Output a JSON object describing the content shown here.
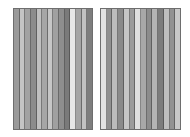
{
  "figure": {
    "panels": [
      {
        "id": "left",
        "stripes": [
          "#9a9a9a",
          "#c4c4c4",
          "#a2a2a2",
          "#8c8c8c",
          "#c0c0c0",
          "#a6a6a6",
          "#c6c6c6",
          "#a0a0a0",
          "#8e8e8e",
          "#7a7a7a",
          "#e6e6e6",
          "#a4a4a4",
          "#c2c2c2",
          "#7e7e7e"
        ]
      },
      {
        "id": "right",
        "stripes": [
          "#e2e2e2",
          "#909090",
          "#bcbcbc",
          "#8a8a8a",
          "#c6c6c6",
          "#9c9c9c",
          "#e0e0e0",
          "#a8a8a8",
          "#8c8c8c",
          "#b4b4b4",
          "#7c7c7c",
          "#bebebe",
          "#929292",
          "#c8c8c8"
        ]
      }
    ],
    "frame_color": "#6e6e6e",
    "background": "#ffffff"
  }
}
